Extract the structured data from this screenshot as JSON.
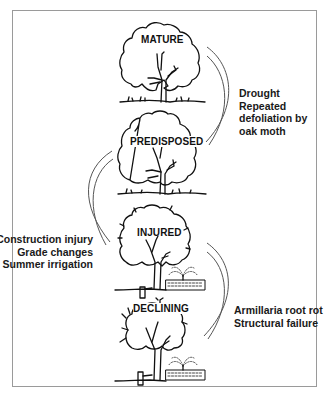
{
  "diagram": {
    "type": "tree-decline-spiral",
    "stages": [
      {
        "id": "mature",
        "label": "MATURE"
      },
      {
        "id": "predisposed",
        "label": "PREDISPOSED"
      },
      {
        "id": "injured",
        "label": "INJURED"
      },
      {
        "id": "declining",
        "label": "DECLINING"
      }
    ],
    "factors": [
      {
        "between": [
          "mature",
          "predisposed"
        ],
        "side": "right",
        "lines": [
          "Drought",
          "Repeated",
          "defoliation by",
          "oak moth"
        ]
      },
      {
        "between": [
          "predisposed",
          "injured"
        ],
        "side": "left",
        "lines": [
          "Construction injury",
          "Grade changes",
          "Summer irrigation"
        ]
      },
      {
        "between": [
          "injured",
          "declining"
        ],
        "side": "right",
        "lines": [
          "Armillaria root rot",
          "Structural failure"
        ]
      }
    ],
    "colors": {
      "ink": "#111111",
      "frame": "#9a9a9a",
      "arc": "#555555",
      "background": "#ffffff"
    }
  }
}
